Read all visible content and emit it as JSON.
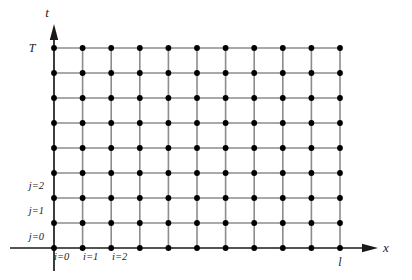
{
  "figure": {
    "background_color": "#ffffff",
    "grid_line_color": "#8c8c8c",
    "node_color": "#000000",
    "axis_color": "#1a1a1a"
  },
  "axes": {
    "vertical": {
      "name": "t-axis",
      "label": "t",
      "label_x": 47,
      "label_y": 17,
      "x": 54,
      "y_top": 30,
      "y_bottom": 271,
      "arrow": "up"
    },
    "horizontal": {
      "name": "x-axis",
      "label": "x",
      "label_x": 386,
      "label_y": 252,
      "y": 248,
      "x_left": 10,
      "x_right": 372,
      "arrow": "right"
    }
  },
  "tick_labels": [
    {
      "text": "T",
      "x": 32,
      "y": 52,
      "anchor": "middle",
      "name": "t-max-label"
    },
    {
      "text": "l",
      "x": 340,
      "y": 266,
      "anchor": "middle",
      "name": "x-max-label"
    }
  ],
  "row_labels": [
    {
      "text": "j=2",
      "x": 44,
      "y": 189,
      "name": "row-label-j2"
    },
    {
      "text": "j=1",
      "x": 44,
      "y": 214,
      "name": "row-label-j1"
    },
    {
      "text": "j=0",
      "x": 44,
      "y": 240,
      "name": "row-label-j0"
    }
  ],
  "column_labels": [
    {
      "text": "i=0",
      "x": 54,
      "y": 260,
      "name": "column-label-i0"
    },
    {
      "text": "i=1",
      "x": 83,
      "y": 260,
      "name": "column-label-i1"
    },
    {
      "text": "i=2",
      "x": 112,
      "y": 260,
      "name": "column-label-i2"
    }
  ],
  "chart_data": {
    "type": "scatter",
    "xlabel": "x",
    "ylabel": "t",
    "grid": true,
    "legend": null,
    "columns": 11,
    "rows": 9,
    "x_indices": [
      0,
      1,
      2,
      3,
      4,
      5,
      6,
      7,
      8,
      9,
      10
    ],
    "t_indices": [
      0,
      1,
      2,
      3,
      4,
      5,
      6,
      7,
      8
    ],
    "x_pixel_positions": [
      54,
      82.6,
      111.2,
      139.8,
      168.4,
      197,
      225.6,
      254.2,
      282.8,
      311.4,
      340
    ],
    "y_pixel_positions": [
      248,
      223,
      198,
      173,
      148,
      123,
      98,
      73,
      48
    ],
    "xlim": [
      0,
      10
    ],
    "ylim": [
      0,
      8
    ],
    "x_tick_labels": [
      "i=0",
      "i=1",
      "i=2",
      "",
      "",
      "",
      "",
      "",
      "",
      "",
      "l"
    ],
    "y_tick_labels": [
      "j=0",
      "j=1",
      "j=2",
      "",
      "",
      "",
      "",
      "",
      "T"
    ],
    "node_count": 99,
    "annotations": [
      "T marks the top grid line (t = T)",
      "l marks the right-most grid column (x = l)",
      "j indexes time rows from the bottom",
      "i indexes space columns from the left"
    ]
  }
}
